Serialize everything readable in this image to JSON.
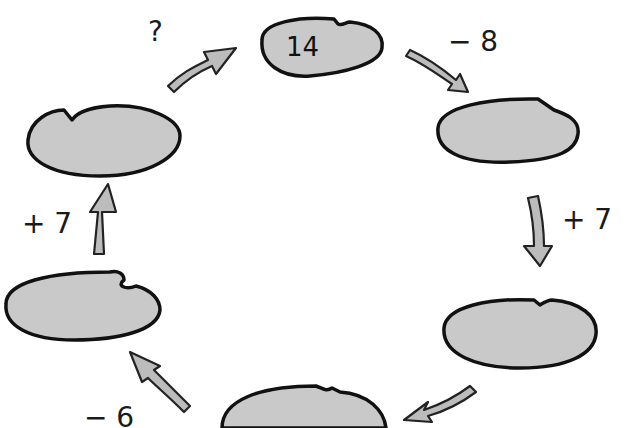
{
  "puzzle": {
    "type": "number-cycle",
    "colors": {
      "pad_fill": "#c8c8c8",
      "pad_stroke": "#111111",
      "arrow_fill": "#bdbdbd",
      "background": "#ffffff"
    },
    "pads": [
      {
        "id": "top",
        "value": "14"
      },
      {
        "id": "right-upper",
        "value": ""
      },
      {
        "id": "right-lower",
        "value": ""
      },
      {
        "id": "bottom",
        "value": ""
      },
      {
        "id": "left-lower",
        "value": ""
      },
      {
        "id": "left-upper",
        "value": ""
      }
    ],
    "operations": [
      {
        "from": "top",
        "to": "right-upper",
        "label": "− 8"
      },
      {
        "from": "right-upper",
        "to": "right-lower",
        "label": "+ 7"
      },
      {
        "from": "right-lower",
        "to": "bottom",
        "label": ""
      },
      {
        "from": "bottom",
        "to": "left-lower",
        "label": "− 6"
      },
      {
        "from": "left-lower",
        "to": "left-upper",
        "label": "+ 7"
      },
      {
        "from": "left-upper",
        "to": "top",
        "label": "?"
      }
    ]
  }
}
